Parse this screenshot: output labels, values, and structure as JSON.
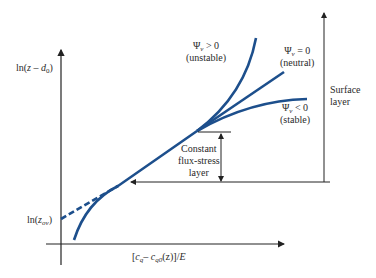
{
  "figure": {
    "y_axis_label": {
      "prefix": "ln(",
      "var": "z",
      "mid": " – ",
      "d": "d",
      "sub": "0",
      "suffix": ")"
    },
    "x_axis_label": {
      "text": "[c_q – c_q0(z)]/E",
      "open": "[",
      "c1": "c",
      "s1": "q",
      "minus": "– ",
      "c2": "c",
      "s2": "q0",
      "rest": "(z)]/",
      "E": "E"
    },
    "intercept_label": {
      "prefix": "ln(",
      "var": "z",
      "sub": "ov",
      "suffix": ")"
    },
    "curves": [
      {
        "id": "unstable",
        "symbol": "Ψ",
        "sub": "v",
        "relation": " > 0",
        "desc": "(unstable)"
      },
      {
        "id": "neutral",
        "symbol": "Ψ",
        "sub": "v",
        "relation": " = 0",
        "desc": "(neutral)"
      },
      {
        "id": "stable",
        "symbol": "Ψ",
        "sub": "v",
        "relation": " < 0",
        "desc": "(stable)"
      }
    ],
    "constant_layer_label": [
      "Constant",
      "flux-stress",
      "layer"
    ],
    "surface_layer_label": [
      "Surface",
      "layer"
    ],
    "colors": {
      "curve": "#1d4f8c",
      "axis": "#222222"
    }
  }
}
